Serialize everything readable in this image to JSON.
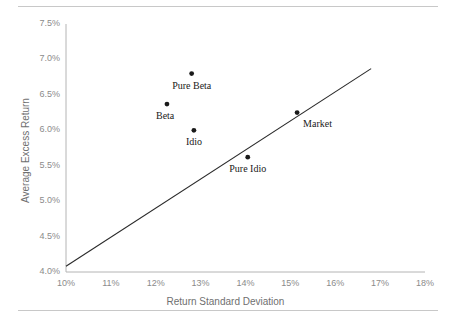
{
  "chart_data": {
    "type": "scatter",
    "title": "",
    "xlabel": "Return Standard Deviation",
    "ylabel": "Average Excess Return",
    "xlim": [
      10,
      18
    ],
    "ylim": [
      4.0,
      7.5
    ],
    "grid": false,
    "legend": "none",
    "xticks": [
      "10%",
      "11%",
      "12%",
      "13%",
      "14%",
      "15%",
      "16%",
      "17%",
      "18%"
    ],
    "xtick_values": [
      10,
      11,
      12,
      13,
      14,
      15,
      16,
      17,
      18
    ],
    "yticks": [
      "4.0%",
      "4.5%",
      "5.0%",
      "5.5%",
      "6.0%",
      "6.5%",
      "7.0%",
      "7.5%"
    ],
    "ytick_values": [
      4.0,
      4.5,
      5.0,
      5.5,
      6.0,
      6.5,
      7.0,
      7.5
    ],
    "points": [
      {
        "name": "Pure Beta",
        "x": 12.8,
        "y": 6.8,
        "label_dx": 0,
        "label_dy": 13,
        "label_anchor": "middle"
      },
      {
        "name": "Beta",
        "x": 12.25,
        "y": 6.37,
        "label_dx": -2,
        "label_dy": 13,
        "label_anchor": "middle"
      },
      {
        "name": "Idio",
        "x": 12.85,
        "y": 6.0,
        "label_dx": 0,
        "label_dy": 13,
        "label_anchor": "middle"
      },
      {
        "name": "Pure Idio",
        "x": 14.05,
        "y": 5.62,
        "label_dx": 0,
        "label_dy": 13,
        "label_anchor": "middle"
      },
      {
        "name": "Market",
        "x": 15.15,
        "y": 6.25,
        "label_dx": 6,
        "label_dy": 12,
        "label_anchor": "start"
      }
    ],
    "series": [
      {
        "name": "Capital Market Line",
        "type": "line",
        "x": [
          10.0,
          16.8
        ],
        "values": [
          4.08,
          6.87
        ]
      }
    ],
    "marker_color": "#1a1a1a",
    "line_color": "#2a2a2a",
    "axis_color": "#b4b4b4",
    "tick_text_color": "#8b8b8b",
    "label_text_color": "#1a1a1a"
  }
}
